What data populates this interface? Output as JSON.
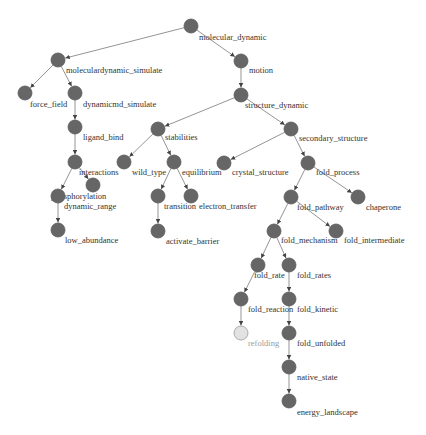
{
  "graph": {
    "node_radius": 7,
    "colors": {
      "node_fill": "#666666",
      "node_fill_dim": "#e2e2e2",
      "edge": "#888888",
      "label": "#333333",
      "label_dim": "#9a9a9a"
    },
    "nodes": [
      {
        "id": "molecular_dynamic",
        "label": "molecular_dynamic",
        "x": 191,
        "y": 26,
        "lx": 8,
        "ly": 14
      },
      {
        "id": "moleculardynamic_simulate",
        "label": "moleculardynamic_simulate",
        "x": 58,
        "y": 60,
        "lx": 8,
        "ly": 13
      },
      {
        "id": "motion",
        "label": "motion",
        "x": 241,
        "y": 61,
        "lx": 8,
        "ly": 12
      },
      {
        "id": "force_field",
        "label": "force_field",
        "x": 25,
        "y": 93,
        "lx": 5,
        "ly": 14
      },
      {
        "id": "dynamicmd_simulate",
        "label": "dynamicmd_simulate",
        "x": 75,
        "y": 93,
        "lx": 8,
        "ly": 14
      },
      {
        "id": "structure_dynamic",
        "label": "structure_dynamic",
        "x": 241,
        "y": 95,
        "lx": 4,
        "ly": 13
      },
      {
        "id": "ligand_bind",
        "label": "ligand_bind",
        "x": 75,
        "y": 127,
        "lx": 8,
        "ly": 13
      },
      {
        "id": "stabilities",
        "label": "stabilities",
        "x": 158,
        "y": 129,
        "lx": 7,
        "ly": 11
      },
      {
        "id": "secondary_structure",
        "label": "secondary_structure",
        "x": 291,
        "y": 129,
        "lx": 8,
        "ly": 12
      },
      {
        "id": "interactions",
        "label": "interactions",
        "x": 75,
        "y": 162,
        "lx": 4,
        "ly": 13
      },
      {
        "id": "wild_type",
        "label": "wild_type",
        "x": 124,
        "y": 162,
        "lx": 8,
        "ly": 13
      },
      {
        "id": "equilibrium",
        "label": "equilibrium",
        "x": 174,
        "y": 162,
        "lx": 8,
        "ly": 13
      },
      {
        "id": "crystal_structure",
        "label": "crystal_structure",
        "x": 224,
        "y": 163,
        "lx": 8,
        "ly": 12
      },
      {
        "id": "fold_process",
        "label": "fold_process",
        "x": 308,
        "y": 163,
        "lx": 8,
        "ly": 12
      },
      {
        "id": "phosphorylation",
        "label": "phosphorylation",
        "x": 93,
        "y": 185,
        "lx": -42,
        "ly": 14
      },
      {
        "id": "dynamic_range",
        "label": "dynamic_range",
        "x": 58,
        "y": 196,
        "lx": 6,
        "ly": 13
      },
      {
        "id": "transition",
        "label": "transition",
        "x": 158,
        "y": 196,
        "lx": 6,
        "ly": 13
      },
      {
        "id": "electron_transfer",
        "label": "electron_transfer",
        "x": 191,
        "y": 196,
        "lx": 8,
        "ly": 13
      },
      {
        "id": "fold_pathway",
        "label": "fold_pathway",
        "x": 291,
        "y": 197,
        "lx": 6,
        "ly": 13
      },
      {
        "id": "chaperone",
        "label": "chaperone",
        "x": 358,
        "y": 197,
        "lx": 8,
        "ly": 13
      },
      {
        "id": "low_abundance",
        "label": "low_abundance",
        "x": 58,
        "y": 230,
        "lx": 7,
        "ly": 13
      },
      {
        "id": "activate_barrier",
        "label": "activate_barrier",
        "x": 158,
        "y": 231,
        "lx": 8,
        "ly": 13
      },
      {
        "id": "fold_mechanism",
        "label": "fold_mechanism",
        "x": 274,
        "y": 231,
        "lx": 7,
        "ly": 12
      },
      {
        "id": "fold_intermediate",
        "label": "fold_intermediate",
        "x": 336,
        "y": 231,
        "lx": 8,
        "ly": 12
      },
      {
        "id": "fold_rate",
        "label": "fold_rate",
        "x": 258,
        "y": 265,
        "lx": -4,
        "ly": 13
      },
      {
        "id": "fold_rates",
        "label": "fold_rates",
        "x": 289,
        "y": 265,
        "lx": 8,
        "ly": 13
      },
      {
        "id": "fold_reaction",
        "label": "fold_reaction",
        "x": 241,
        "y": 299,
        "lx": 7,
        "ly": 13
      },
      {
        "id": "fold_kinetic",
        "label": "fold_kinetic",
        "x": 289,
        "y": 299,
        "lx": 8,
        "ly": 13
      },
      {
        "id": "refolding",
        "label": "refolding",
        "x": 241,
        "y": 333,
        "lx": 7,
        "ly": 13,
        "dim": true
      },
      {
        "id": "fold_unfolded",
        "label": "fold_unfolded",
        "x": 289,
        "y": 333,
        "lx": 8,
        "ly": 13
      },
      {
        "id": "native_state",
        "label": "native_state",
        "x": 289,
        "y": 367,
        "lx": 8,
        "ly": 13
      },
      {
        "id": "energy_landscape",
        "label": "energy_landscape",
        "x": 289,
        "y": 401,
        "lx": 8,
        "ly": 14
      }
    ],
    "edges": [
      [
        "molecular_dynamic",
        "moleculardynamic_simulate"
      ],
      [
        "molecular_dynamic",
        "motion"
      ],
      [
        "moleculardynamic_simulate",
        "force_field"
      ],
      [
        "moleculardynamic_simulate",
        "dynamicmd_simulate"
      ],
      [
        "dynamicmd_simulate",
        "ligand_bind"
      ],
      [
        "ligand_bind",
        "interactions"
      ],
      [
        "interactions",
        "dynamic_range"
      ],
      [
        "interactions",
        "phosphorylation"
      ],
      [
        "dynamic_range",
        "low_abundance"
      ],
      [
        "motion",
        "structure_dynamic"
      ],
      [
        "structure_dynamic",
        "stabilities"
      ],
      [
        "structure_dynamic",
        "secondary_structure"
      ],
      [
        "stabilities",
        "wild_type"
      ],
      [
        "stabilities",
        "equilibrium"
      ],
      [
        "equilibrium",
        "transition"
      ],
      [
        "equilibrium",
        "electron_transfer"
      ],
      [
        "transition",
        "activate_barrier"
      ],
      [
        "secondary_structure",
        "crystal_structure"
      ],
      [
        "secondary_structure",
        "fold_process"
      ],
      [
        "fold_process",
        "fold_pathway"
      ],
      [
        "fold_process",
        "chaperone"
      ],
      [
        "fold_pathway",
        "fold_mechanism"
      ],
      [
        "fold_pathway",
        "fold_intermediate"
      ],
      [
        "fold_mechanism",
        "fold_rate"
      ],
      [
        "fold_mechanism",
        "fold_rates"
      ],
      [
        "fold_rate",
        "fold_reaction"
      ],
      [
        "fold_reaction",
        "refolding"
      ],
      [
        "fold_rates",
        "fold_kinetic"
      ],
      [
        "fold_kinetic",
        "fold_unfolded"
      ],
      [
        "fold_unfolded",
        "native_state"
      ],
      [
        "native_state",
        "energy_landscape"
      ]
    ]
  }
}
